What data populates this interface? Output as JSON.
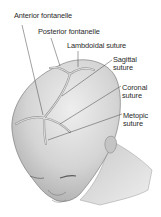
{
  "figure": {
    "labels": [
      {
        "id": "anterior-fontanelle",
        "text": "Anterior fontanelle",
        "lines": [
          "Anterior fontanelle"
        ]
      },
      {
        "id": "posterior-fontanelle",
        "text": "Posterior fontanelle",
        "lines": [
          "Posterior fontanelle"
        ]
      },
      {
        "id": "lambdoidal-suture",
        "text": "Lambdoidal suture",
        "lines": [
          "Lambdoidal suture"
        ]
      },
      {
        "id": "sagittal-suture",
        "text": "Sagittal suture",
        "lines": [
          "Sagittal",
          "suture"
        ]
      },
      {
        "id": "coronal-suture",
        "text": "Coronal suture",
        "lines": [
          "Coronal",
          "suture"
        ]
      },
      {
        "id": "metopic-suture",
        "text": "Metopic suture",
        "lines": [
          "Metopic",
          "suture"
        ]
      }
    ],
    "colors": {
      "background": "#ffffff",
      "skin": "#cfcfcf",
      "skin_light": "#e6e6e6",
      "suture": "#9a9a9a",
      "outline": "#6e6e6e",
      "leader": "#444444",
      "text": "#2a2a2a"
    }
  }
}
